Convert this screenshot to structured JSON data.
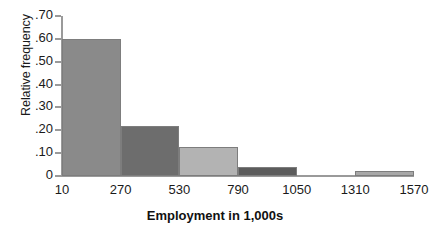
{
  "chart_data": {
    "type": "bar",
    "title": "",
    "subtitle": "",
    "xlabel": "Employment in 1,000s",
    "ylabel": "Relative frequency",
    "grid": false,
    "legend": "none",
    "xlim": [
      10,
      1570
    ],
    "ylim": [
      0,
      0.7
    ],
    "bin_width": 260,
    "x_ticks": [
      "10",
      "270",
      "530",
      "790",
      "1050",
      "1310",
      "1570"
    ],
    "x_tick_values": [
      10,
      270,
      530,
      790,
      1050,
      1310,
      1570
    ],
    "y_ticks": [
      "0",
      ".10",
      ".20",
      ".30",
      ".40",
      ".50",
      ".60",
      ".70"
    ],
    "y_tick_values": [
      0,
      0.1,
      0.2,
      0.3,
      0.4,
      0.5,
      0.6,
      0.7
    ],
    "categories": [
      "10-270",
      "270-530",
      "530-790",
      "790-1050",
      "1050-1310",
      "1310-1570"
    ],
    "values": [
      0.6,
      0.22,
      0.125,
      0.04,
      0.0,
      0.02
    ],
    "bars": [
      {
        "label": "10-270",
        "bin_start": 10,
        "bin_end": 270,
        "value": 0.6,
        "color": "#8a8a8a"
      },
      {
        "label": "270-530",
        "bin_start": 270,
        "bin_end": 530,
        "value": 0.22,
        "color": "#6d6d6d"
      },
      {
        "label": "530-790",
        "bin_start": 530,
        "bin_end": 790,
        "value": 0.125,
        "color": "#b3b3b3"
      },
      {
        "label": "790-1050",
        "bin_start": 790,
        "bin_end": 1050,
        "value": 0.04,
        "color": "#5c5c5c"
      },
      {
        "label": "1050-1310",
        "bin_start": 1050,
        "bin_end": 1310,
        "value": 0.0,
        "color": "#ffffff"
      },
      {
        "label": "1310-1570",
        "bin_start": 1310,
        "bin_end": 1570,
        "value": 0.02,
        "color": "#a8a8a8"
      }
    ],
    "axis_color": "#9a9a9a",
    "text_color": "#1a1a1a",
    "background": "#ffffff"
  }
}
